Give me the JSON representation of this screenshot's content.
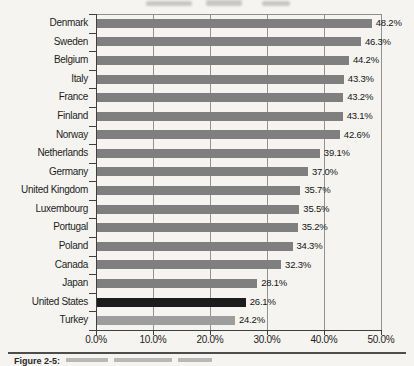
{
  "figure": {
    "caption_label": "Figure 2-5:"
  },
  "chart_data": {
    "type": "bar",
    "orientation": "horizontal",
    "title": "",
    "xlabel": "",
    "ylabel": "",
    "xlim": [
      0,
      50
    ],
    "grid": true,
    "x_tick_labels": [
      "0.0%",
      "10.0%",
      "20.0%",
      "30.0%",
      "40.0%",
      "50.0%"
    ],
    "categories": [
      "Denmark",
      "Sweden",
      "Belgium",
      "Italy",
      "France",
      "Finland",
      "Norway",
      "Netherlands",
      "Germany",
      "United Kingdom",
      "Luxembourg",
      "Portugal",
      "Poland",
      "Canada",
      "Japan",
      "United States",
      "Turkey"
    ],
    "values": [
      48.2,
      46.3,
      44.2,
      43.3,
      43.2,
      43.1,
      42.6,
      39.1,
      37.0,
      35.7,
      35.5,
      35.2,
      34.3,
      32.3,
      28.1,
      26.1,
      24.2
    ],
    "value_labels": [
      "48.2%",
      "46.3%",
      "44.2%",
      "43.3%",
      "43.2%",
      "43.1%",
      "42.6%",
      "39.1%",
      "37.0%",
      "35.7%",
      "35.5%",
      "35.2%",
      "34.3%",
      "32.3%",
      "28.1%",
      "26.1%",
      "24.2%"
    ],
    "highlighted_category": "United States",
    "colors": {
      "bar_default": "#7f7f7f",
      "bar_united_states": "#1c1c1c",
      "bar_turkey": "#9d9d9d",
      "axis": "#3f3f3f",
      "grid": "#8f8f8f",
      "text": "#1d1d1d",
      "background": "#f5f4f1"
    }
  }
}
